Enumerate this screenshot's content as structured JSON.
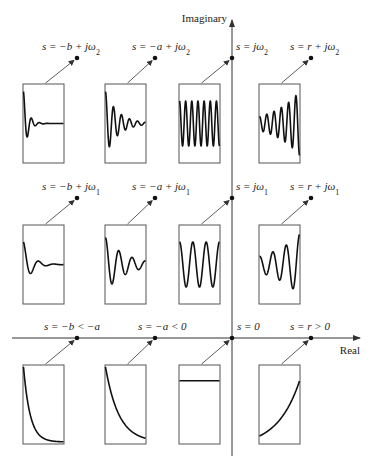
{
  "axes": {
    "imaginary_label": "Imaginary",
    "real_label": "Real",
    "origin": {
      "x": 232,
      "y": 338
    },
    "imag_top": 20,
    "imag_bottom": 456,
    "real_left": 12,
    "real_right": 360
  },
  "box": {
    "width": 41,
    "height": 79
  },
  "columns": [
    {
      "box_x": 23,
      "dot_x": 77
    },
    {
      "box_x": 105,
      "dot_x": 155
    },
    {
      "box_x": 179,
      "dot_x": 232
    },
    {
      "box_x": 259,
      "dot_x": 311
    }
  ],
  "rows": [
    {
      "box_y": 84,
      "dot_y": 58
    },
    {
      "box_y": 225,
      "dot_y": 198
    },
    {
      "box_y": 365,
      "dot_y": 338
    }
  ],
  "points": [
    {
      "id": "p-b-jw2",
      "row": 0,
      "col": 0,
      "label_parts": [
        "s = −b + j",
        "ω",
        "2"
      ],
      "label_x": 42,
      "signal": {
        "kind": "damped",
        "decay": 9.0,
        "cycles": 5.0,
        "amp": 0.85
      }
    },
    {
      "id": "p-a-jw2",
      "row": 0,
      "col": 1,
      "label_parts": [
        "s = −a + j",
        "ω",
        "2"
      ],
      "label_x": 132,
      "signal": {
        "kind": "damped",
        "decay": 3.2,
        "cycles": 5.0,
        "amp": 0.85
      }
    },
    {
      "id": "p-0-jw2",
      "row": 0,
      "col": 2,
      "label_parts": [
        "s = j",
        "ω",
        "2"
      ],
      "label_x": 236,
      "signal": {
        "kind": "sustained",
        "cycles": 6.5,
        "amp": 0.6
      }
    },
    {
      "id": "p-r-jw2",
      "row": 0,
      "col": 3,
      "label_parts": [
        "s = r + j",
        "ω",
        "2"
      ],
      "label_x": 290,
      "signal": {
        "kind": "growing",
        "growth": 1.5,
        "cycles": 5.5,
        "amp": 0.85
      }
    },
    {
      "id": "p-b-jw1",
      "row": 1,
      "col": 0,
      "label_parts": [
        "s = −b + j",
        "ω",
        "1"
      ],
      "label_x": 42,
      "signal": {
        "kind": "damped",
        "decay": 5.0,
        "cycles": 2.6,
        "amp": 0.6
      }
    },
    {
      "id": "p-a-jw1",
      "row": 1,
      "col": 1,
      "label_parts": [
        "s = −a + j",
        "ω",
        "1"
      ],
      "label_x": 132,
      "signal": {
        "kind": "damped",
        "decay": 2.0,
        "cycles": 3.0,
        "amp": 0.72
      }
    },
    {
      "id": "p-0-jw1",
      "row": 1,
      "col": 2,
      "label_parts": [
        "s = j",
        "ω",
        "1"
      ],
      "label_x": 236,
      "signal": {
        "kind": "sustained",
        "cycles": 3.0,
        "amp": 0.6
      }
    },
    {
      "id": "p-r-jw1",
      "row": 1,
      "col": 3,
      "label_parts": [
        "s = r + j",
        "ω",
        "1"
      ],
      "label_x": 290,
      "signal": {
        "kind": "growing",
        "growth": 1.3,
        "cycles": 3.0,
        "amp": 0.8
      }
    },
    {
      "id": "p-b-real",
      "row": 2,
      "col": 0,
      "label_parts": [
        "s = −b < −a",
        "",
        ""
      ],
      "label_x": 44,
      "signal": {
        "kind": "exp_decay",
        "rate": 6.0
      }
    },
    {
      "id": "p-a-real",
      "row": 2,
      "col": 1,
      "label_parts": [
        "s = −a < 0",
        "",
        ""
      ],
      "label_x": 138,
      "signal": {
        "kind": "exp_decay",
        "rate": 3.0
      }
    },
    {
      "id": "p-0-real",
      "row": 2,
      "col": 2,
      "label_parts": [
        "s = 0",
        "",
        ""
      ],
      "label_x": 237,
      "signal": {
        "kind": "constant",
        "level": 0.2
      }
    },
    {
      "id": "p-r-real",
      "row": 2,
      "col": 3,
      "label_parts": [
        "s = r > 0",
        "",
        ""
      ],
      "label_x": 290,
      "signal": {
        "kind": "exp_growth",
        "rate": 1.8
      }
    }
  ]
}
